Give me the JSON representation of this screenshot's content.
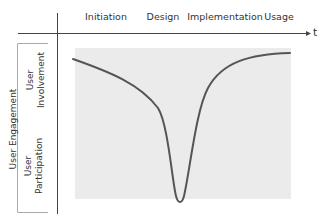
{
  "diagram": {
    "time_axis_label": "t",
    "phases": [
      "Initiation",
      "Design",
      "Implementation",
      "Usage"
    ],
    "y_axis_group_label": "User Engagement",
    "y_axis_sublabels": {
      "top": "User Involvement",
      "bottom": "User Participation"
    },
    "colors": {
      "panel": "#ebebeb",
      "curve": "#555555",
      "axis": "#444444"
    },
    "curve_description": "Engagement declines gradually through Initiation and Design, drops sharply to a minimum during Implementation, then rises back to a high level during Usage"
  }
}
